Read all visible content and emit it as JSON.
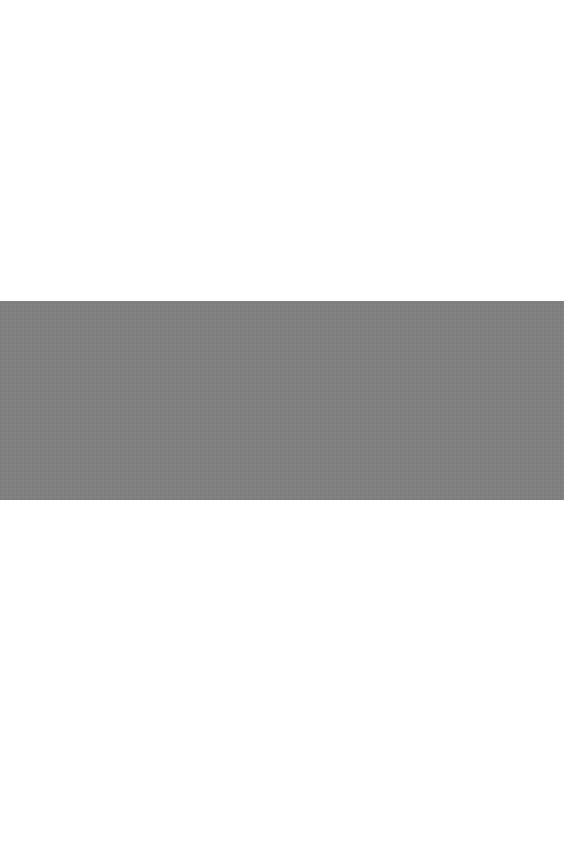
{
  "page": {
    "background_color": "#ffffff",
    "band": {
      "color": "#808080",
      "top_px": 301,
      "height_px": 199
    },
    "visible_text": []
  }
}
